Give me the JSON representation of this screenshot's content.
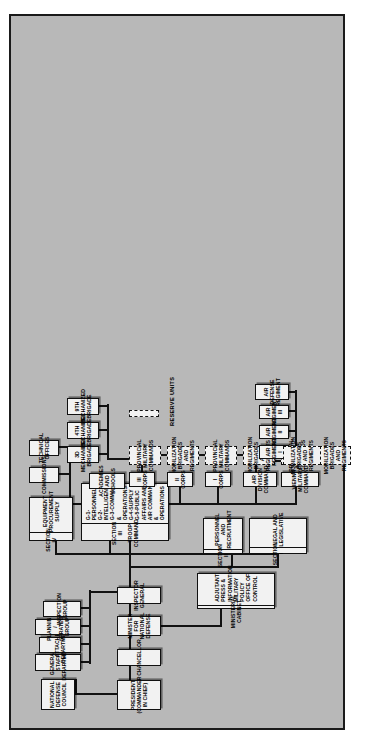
{
  "chart": {
    "type": "org-chart",
    "legend": {
      "label": "RESERVE UNITS",
      "style": "dashed-box"
    }
  },
  "nodes": {
    "president": {
      "line1": "PRESIDENT",
      "line2": "(COMMANDER IN CHIEF)"
    },
    "chancellor": {
      "line1": "CHANCELLOR"
    },
    "minister": {
      "line1": "MINISTER FOR",
      "line2": "NATIONAL DEFENSE"
    },
    "inspector_general": {
      "line1": "INSPECTOR GENERAL"
    },
    "national_defense_council": {
      "line1": "NATIONAL",
      "line2": "DEFENSE COUNCIL"
    },
    "ministerial_cabinet": {
      "header": "MINISTERIAL CABINET",
      "items": [
        "ADJUTANT",
        "PRESS & INFORMATION",
        "MILITARY POLICY",
        "OFFICE OF CONTROL"
      ]
    },
    "general_staff_department": {
      "line1": "GENERAL STAFF DEPARTMENT"
    },
    "attache_department": {
      "line1": "ATTACHE DEPARTMENT"
    },
    "planning_strategy_group": {
      "line1": "PLANNING / STRATEGY GROUP"
    },
    "inspection_group": {
      "line1": "INSPECTION GROUP"
    },
    "section_1": {
      "header": "SECTION I",
      "body": "LEGAL AND\nLEGISLATIVE"
    },
    "section_2": {
      "header": "SECTION II",
      "body": "PERSONNEL AND\nRECRUITMENT"
    },
    "section_3": {
      "header": "SECTION III",
      "subheader": "TROOP  COMMAND",
      "items": [
        "G-1-PERSONNEL",
        "G-2-INTELLIGENCE",
        "G-3-COMMAND & OPERATIONS",
        "G-4-SUPPLY",
        "G-5-PUBLIC AFFAIRS AND",
        "AIR COMMAND & OPERATIONS"
      ]
    },
    "section_4": {
      "header": "SECTION IV",
      "body": "EQUIPMENT\nPROCUREMENT\nSUPPLY"
    },
    "academies_and_schools": {
      "line1": "ACADEMIES AND",
      "line2": "SCHOOLS"
    },
    "commissions": {
      "line1": "COMMISSIONS"
    },
    "technical_offices": {
      "line1": "TECHNICAL",
      "line2": "OFFICES"
    },
    "vienna_military_command": {
      "line1": "VIENNA",
      "line2": "MILITARY COMMAND"
    },
    "vienna_mobilization": {
      "line1": "MOBILIZATION",
      "line2": "BRIGADES AND",
      "line3": "REGIMENTS"
    },
    "air_division_command": {
      "line1": "AIR DIVISION",
      "line2": "COMMAND"
    },
    "air_regiment_1": {
      "line1": "AIR REGIMENT I"
    },
    "air_regiment_2": {
      "line1": "AIR REGIMENT II"
    },
    "air_regiment_3": {
      "line1": "AIR REGIMENT III"
    },
    "air_defense_regiment": {
      "line1": "AIR DEFENSE",
      "line2": "REGIMENT"
    },
    "i_corps": {
      "line1": "I CORPS"
    },
    "ii_corps": {
      "line1": "II CORPS"
    },
    "iii_corps": {
      "line1": "III CORPS"
    },
    "provincial_military_commands": {
      "line1": "PROVINCIAL",
      "line2": "MILITARY",
      "line3": "COMMANDS"
    },
    "mobilization_brigades_regiments": {
      "line1": "MOBILIZATION",
      "line2": "BRIGADES AND",
      "line3": "REGIMENTS"
    },
    "brigade_3d": {
      "line1": "3D",
      "line2": "MECHANIZED",
      "line3": "BRIGADE"
    },
    "brigade_4th": {
      "line1": "4TH",
      "line2": "MECHANIZED",
      "line3": "BRIGADE"
    },
    "brigade_9th": {
      "line1": "9TH",
      "line2": "MECHANIZED",
      "line3": "BRIGADE"
    }
  },
  "colors": {
    "page_background": "#ffffff",
    "chart_background": "#b8b8b8",
    "box_fill": "#f2f2f2",
    "line": "#111111",
    "text": "#000000"
  }
}
